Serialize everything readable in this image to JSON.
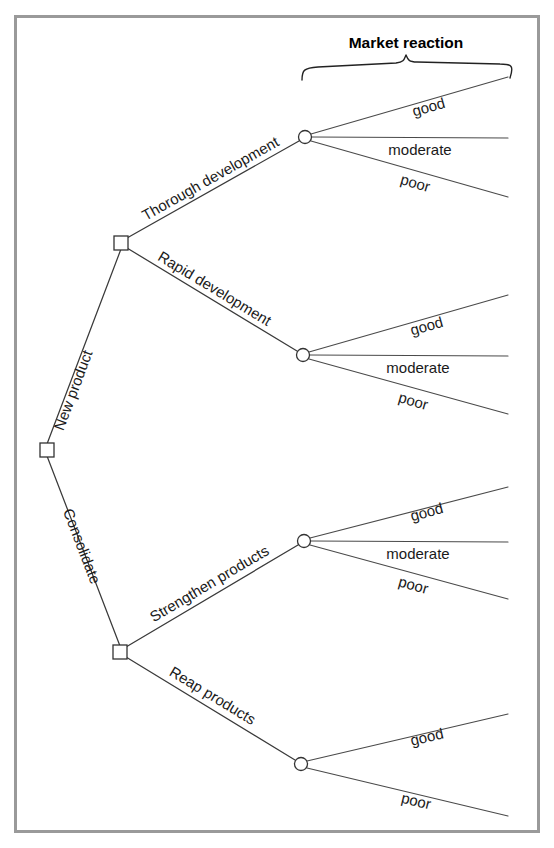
{
  "figure": {
    "type": "decision-tree-diagram",
    "header": {
      "label": "Market reaction"
    },
    "nodes": {
      "root": {
        "kind": "decision",
        "x": 47,
        "y": 450
      },
      "new_product": {
        "kind": "decision",
        "x": 121,
        "y": 243
      },
      "consolidate": {
        "kind": "decision",
        "x": 120,
        "y": 652
      },
      "chance_thorough": {
        "kind": "chance",
        "x": 305,
        "y": 137
      },
      "chance_rapid": {
        "kind": "chance",
        "x": 303,
        "y": 355
      },
      "chance_strengthen": {
        "kind": "chance",
        "x": 304,
        "y": 541
      },
      "chance_reap": {
        "kind": "chance",
        "x": 301,
        "y": 764
      }
    },
    "decisions": [
      {
        "id": "new-product",
        "label": "New product",
        "from": "root",
        "to": "new_product"
      },
      {
        "id": "consolidate",
        "label": "Consolidate",
        "from": "root",
        "to": "consolidate"
      },
      {
        "id": "thorough-development",
        "label": "Thorough development",
        "from": "new_product",
        "to": "chance_thorough"
      },
      {
        "id": "rapid-development",
        "label": "Rapid development",
        "from": "new_product",
        "to": "chance_rapid"
      },
      {
        "id": "strengthen-products",
        "label": "Strengthen products",
        "from": "consolidate",
        "to": "chance_strengthen"
      },
      {
        "id": "reap-products",
        "label": "Reap products",
        "from": "consolidate",
        "to": "chance_reap"
      }
    ],
    "outcomes": {
      "thorough": [
        "good",
        "moderate",
        "poor"
      ],
      "rapid": [
        "good",
        "moderate",
        "poor"
      ],
      "strengthen": [
        "good",
        "moderate",
        "poor"
      ],
      "reap": [
        "good",
        "poor"
      ]
    },
    "colors": {
      "frame": "#9a9a9a",
      "line": "#3a3a3a",
      "text": "#1a1a1a",
      "background": "#ffffff"
    }
  }
}
